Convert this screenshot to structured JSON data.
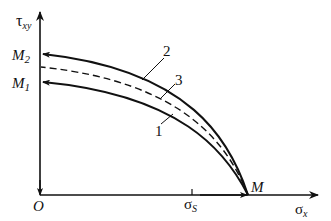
{
  "diagram": {
    "type": "yield-curve-stress-diagram",
    "axes": {
      "y_label_main": "τ",
      "y_label_sub": "xy",
      "x_label_main": "σ",
      "x_label_sub": "x",
      "origin_label": "O"
    },
    "ticks": {
      "x_tick_main": "σ",
      "x_tick_sub": "S"
    },
    "points": {
      "M2_main": "M",
      "M2_sub": "2",
      "M1_main": "M",
      "M1_sub": "1",
      "M": "M"
    },
    "curve_labels": {
      "curve1": "1",
      "curve2": "2",
      "curve3": "3"
    },
    "curves": [
      {
        "id": "1",
        "style": "solid",
        "from": "M1",
        "to": "M"
      },
      {
        "id": "2",
        "style": "solid",
        "from": "M2",
        "to": "M"
      },
      {
        "id": "3",
        "style": "dashed",
        "from": "between M1 and M2",
        "to": "M"
      }
    ],
    "colors": {
      "line": "#111111",
      "background": "#ffffff"
    }
  }
}
